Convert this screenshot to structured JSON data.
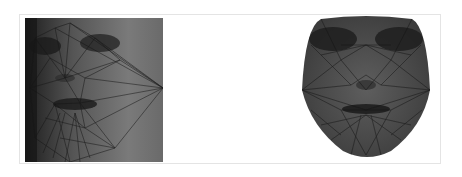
{
  "figure": {
    "panels": [
      {
        "id": "left",
        "description": "Face photo with triangulated landmark mesh (original pose)"
      },
      {
        "id": "right",
        "description": "Face warped to frontal shape with triangulated mesh"
      }
    ],
    "colors": {
      "frame_border": "#e4e4e4",
      "photo_dark": "#2a2a2a",
      "photo_mid": "#6e6e6e",
      "mesh_line": "#1a1a1a"
    }
  }
}
